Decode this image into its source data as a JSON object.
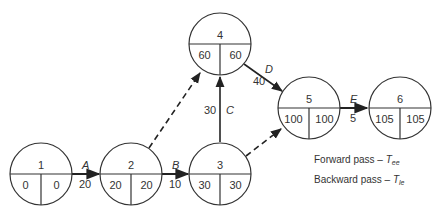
{
  "diagram": {
    "type": "network",
    "nodes": [
      {
        "id": "1",
        "cx": 41,
        "cy": 174,
        "left": "0",
        "right": "0"
      },
      {
        "id": "2",
        "cx": 131,
        "cy": 174,
        "left": "20",
        "right": "20"
      },
      {
        "id": "3",
        "cx": 220,
        "cy": 174,
        "left": "30",
        "right": "30"
      },
      {
        "id": "4",
        "cx": 220,
        "cy": 44,
        "left": "60",
        "right": "60"
      },
      {
        "id": "5",
        "cx": 309,
        "cy": 108,
        "left": "100",
        "right": "100"
      },
      {
        "id": "6",
        "cx": 400,
        "cy": 108,
        "left": "105",
        "right": "105"
      }
    ],
    "edges": [
      {
        "from": "1",
        "to": "2",
        "activity": "A",
        "duration": "20",
        "dashed": false
      },
      {
        "from": "2",
        "to": "3",
        "activity": "B",
        "duration": "10",
        "dashed": false
      },
      {
        "from": "3",
        "to": "4",
        "activity": "C",
        "duration": "30",
        "dashed": false
      },
      {
        "from": "4",
        "to": "5",
        "activity": "D",
        "duration": "40",
        "dashed": false
      },
      {
        "from": "5",
        "to": "6",
        "activity": "E",
        "duration": "5",
        "dashed": false
      },
      {
        "from": "2",
        "to": "4",
        "activity": "",
        "duration": "",
        "dashed": true
      },
      {
        "from": "3",
        "to": "5",
        "activity": "",
        "duration": "",
        "dashed": true
      }
    ],
    "legend": {
      "forward": {
        "text": "Forward pass – ",
        "symbol": "T",
        "sub": "ee"
      },
      "backward": {
        "text": "Backward pass – ",
        "symbol": "T",
        "sub": "le"
      }
    }
  }
}
